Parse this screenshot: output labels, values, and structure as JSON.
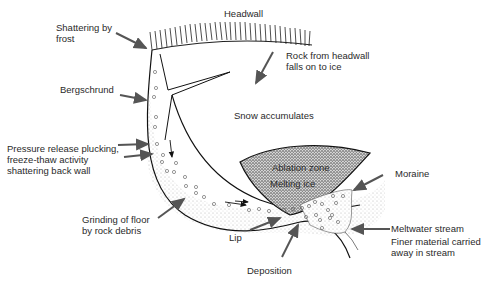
{
  "diagram": {
    "type": "cirque glacier cross-section",
    "labels": {
      "headwall": "Headwall",
      "shattering_1": "Shattering by",
      "shattering_2": "frost",
      "rock_falls_1": "Rock from headwall",
      "rock_falls_2": "falls on to ice",
      "bergschrund": "Bergschrund",
      "snow": "Snow accumulates",
      "plucking_1": "Pressure release plucking,",
      "plucking_2": "freeze-thaw activity",
      "plucking_3": "shattering back wall",
      "ablation": "Ablation zone",
      "melting": "Melting ice",
      "moraine": "Moraine",
      "grinding_1": "Grinding of floor",
      "grinding_2": "by rock debris",
      "lip": "Lip",
      "meltwater": "Meltwater stream",
      "finer_1": "Finer material carried",
      "finer_2": "away in stream",
      "deposition": "Deposition"
    },
    "colors": {
      "line": "#1a1a1a",
      "arrow": "#555555",
      "stipple": "#9a9a9a",
      "text": "#2a2a2a"
    }
  }
}
